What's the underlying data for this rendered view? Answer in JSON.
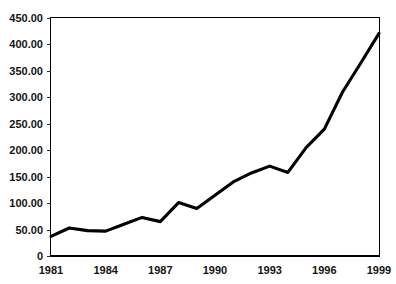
{
  "chart_data": {
    "type": "line",
    "title": "",
    "subtitle": "",
    "xlabel": "",
    "ylabel": "",
    "grid": "horizontal",
    "legend": "none",
    "xlim": [
      1981,
      1999
    ],
    "ylim": [
      0,
      450
    ],
    "x": [
      1981,
      1982,
      1983,
      1984,
      1985,
      1986,
      1987,
      1988,
      1989,
      1990,
      1991,
      1992,
      1993,
      1994,
      1995,
      1996,
      1997,
      1998,
      1999
    ],
    "y_tick_values": [
      0,
      50,
      100,
      150,
      200,
      250,
      300,
      350,
      400,
      450
    ],
    "y_tick_labels": [
      "0",
      "50.00",
      "100.00",
      "150.00",
      "200.00",
      "250.00",
      "300.00",
      "350.00",
      "400.00",
      "450.00"
    ],
    "x_tick_values": [
      1981,
      1984,
      1987,
      1990,
      1993,
      1996,
      1999
    ],
    "x_tick_labels": [
      "1981",
      "1984",
      "1987",
      "1990",
      "1993",
      "1996",
      "1999"
    ],
    "series": [
      {
        "name": "series-1",
        "color": "#000000",
        "line_width": 3,
        "marker": "none",
        "values": [
          37,
          53,
          48,
          47,
          60,
          73,
          65,
          101,
          90,
          115,
          140,
          157,
          170,
          158,
          205,
          240,
          310,
          365,
          421
        ]
      }
    ],
    "colors": {
      "series_line": "#000000",
      "gridline": "#3a3a3a",
      "frame": "#000000",
      "background": "#ffffff",
      "tick_text": "#141414"
    }
  }
}
